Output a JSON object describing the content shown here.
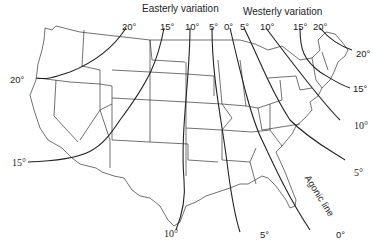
{
  "map": {
    "subject": "Magnetic declination (isogonic lines) over the contiguous United States",
    "headers": {
      "easterly": "Easterly variation",
      "westerly": "Westerly variation"
    },
    "top_labels": {
      "e20": "20°",
      "e15": "15°",
      "e10": "10°",
      "e5": "5°",
      "zero": "0°",
      "w5": "5°",
      "w10": "10°",
      "w15": "15°",
      "w20": "20°"
    },
    "side_labels": {
      "west_20": "20°",
      "west_15": "15°",
      "east_20": "20°",
      "east_15": "15°",
      "east_10": "10°",
      "east_5": "5°"
    },
    "bottom_labels": {
      "b10": "10°",
      "b5": "5°",
      "b0": "0°"
    },
    "agonic_label": "Agonic line",
    "colors": {
      "line": "#222222",
      "border": "#333333",
      "background": "#ffffff"
    }
  }
}
